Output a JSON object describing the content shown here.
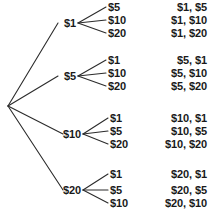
{
  "diagram": {
    "type": "tree-diagram",
    "title": "",
    "root": {
      "label": "",
      "x": 8,
      "y": 106
    },
    "colors": {
      "background": "#ffffff",
      "line": "#2b2b2b",
      "text": "#1a1a1a"
    },
    "groups": [
      {
        "first_bill": "$1",
        "stage1_x": 76,
        "stage1_y": 23,
        "second_bills": [
          "$5",
          "$10",
          "$20"
        ],
        "leaf_x": 108,
        "leaf_ys": [
          7,
          20,
          33
        ],
        "outcomes": [
          "$1, $5",
          "$1, $10",
          "$1, $20"
        ],
        "outcome_x": 207
      },
      {
        "first_bill": "$5",
        "stage1_x": 76,
        "stage1_y": 76,
        "second_bills": [
          "$1",
          "$10",
          "$20"
        ],
        "leaf_x": 108,
        "leaf_ys": [
          60,
          73,
          86
        ],
        "outcomes": [
          "$5, $1",
          "$5, $10",
          "$5, $20"
        ],
        "outcome_x": 207
      },
      {
        "first_bill": "$10",
        "stage1_x": 81,
        "stage1_y": 134,
        "second_bills": [
          "$1",
          "$5",
          "$20"
        ],
        "leaf_x": 110,
        "leaf_ys": [
          118,
          131,
          144
        ],
        "outcomes": [
          "$10, $1",
          "$10, $5",
          "$10, $20"
        ],
        "outcome_x": 207
      },
      {
        "first_bill": "$20",
        "stage1_x": 81,
        "stage1_y": 190,
        "second_bills": [
          "$1",
          "$5",
          "$10"
        ],
        "leaf_x": 110,
        "leaf_ys": [
          174,
          190,
          203
        ],
        "outcomes": [
          "$20, $1",
          "$20, $5",
          "$20, $10"
        ],
        "outcome_x": 207
      }
    ]
  }
}
